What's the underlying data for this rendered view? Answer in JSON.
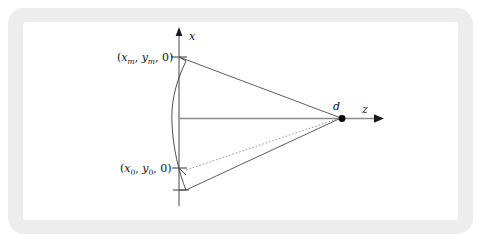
{
  "figure": {
    "type": "optics-ray-diagram",
    "axes": {
      "vertical": {
        "label": "x",
        "name": "x-axis",
        "arrow": "up"
      },
      "horizontal": {
        "label": "z",
        "name": "z-axis",
        "arrow": "right"
      },
      "origin": {
        "x": 179,
        "y": 119
      }
    },
    "points": [
      {
        "id": "upper-point",
        "label_parts": {
          "open": "(",
          "v1": "x",
          "s1": "m",
          "c1": ", ",
          "v2": "y",
          "s2": "m",
          "c2": ", ",
          "v3": "0",
          "close": ")"
        },
        "label_text": "(xm, ym, 0)",
        "coords": {
          "x": 179,
          "y": 57
        }
      },
      {
        "id": "lower-point",
        "label_parts": {
          "open": "(",
          "v1": "x",
          "s1": "0",
          "c1": ", ",
          "v2": "y",
          "s2": "0",
          "c2": ", ",
          "v3": "0",
          "close": ")"
        },
        "label_text": "(x0, y0, 0)",
        "coords": {
          "x": 179,
          "y": 168
        }
      },
      {
        "id": "convergence-point",
        "label_text": "d",
        "coords": {
          "x": 342,
          "y": 118
        }
      }
    ],
    "rays": [
      {
        "id": "upper-ray",
        "style": "solid",
        "from": "upper-point",
        "to": "convergence-point"
      },
      {
        "id": "lower-ray",
        "style": "solid",
        "from": "arc-bottom",
        "to": "convergence-point"
      },
      {
        "id": "chief-ray",
        "style": "dotted",
        "from": "lower-point",
        "to": "convergence-point"
      },
      {
        "id": "optical-axis-ray",
        "style": "solid",
        "from": "origin",
        "to": "convergence-point"
      }
    ],
    "arc": {
      "id": "curved-surface",
      "style": "solid",
      "bulge": "left",
      "top": {
        "x": 186,
        "y": 61
      },
      "mid": {
        "x": 172,
        "y": 124
      },
      "bottom": {
        "x": 186,
        "y": 190
      }
    },
    "colors": {
      "frame": "#ededed",
      "panel": "#ffffff",
      "axis": "#8b8b8b",
      "ray": "#4a4a4a",
      "dotted_ray": "#8a8a8a",
      "arc": "#3d3d3d",
      "dot": "#000000",
      "text": "#111111"
    }
  }
}
